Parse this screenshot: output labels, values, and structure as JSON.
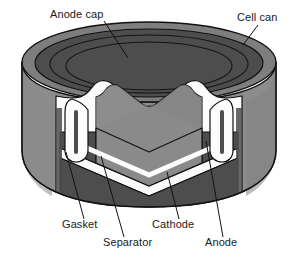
{
  "figure": {
    "view": "three-quarter cutaway with V-shaped wedge removed",
    "background_color": "#ffffff"
  },
  "colors": {
    "cell_can_body": "#8c8c8c",
    "cell_can_top_rim": "#7e7e7e",
    "cathode_dark": "#4d4d4d",
    "anode_mid": "#8a8a8a",
    "anode_cut_face": "#828282",
    "separator_white": "#fbfbfb",
    "gasket_white": "#fcfcfc",
    "outline": "#111111",
    "label_text": "#1a1a1a",
    "leader_line": "#111111"
  },
  "labels": [
    {
      "id": "anode-cap",
      "text": "Anode cap",
      "text_x": 50,
      "text_y": 18,
      "anchor": "start",
      "leader": "M 104 21 L 128 58",
      "points_to": "inner concentric cap disk on top face"
    },
    {
      "id": "cell-can",
      "text": "Cell can",
      "text_x": 237,
      "text_y": 21,
      "anchor": "start",
      "leader": "M 258 25 L 243 45",
      "points_to": "outer steel can wall"
    },
    {
      "id": "gasket",
      "text": "Gasket",
      "text_x": 62,
      "text_y": 228,
      "anchor": "start",
      "leader": "M 84 219 L 66 152",
      "points_to": "white sealing gasket at can rim"
    },
    {
      "id": "separator",
      "text": "Separator",
      "text_x": 103,
      "text_y": 246,
      "anchor": "start",
      "leader": "M 124 237 L 101 156",
      "points_to": "thin white separator layer"
    },
    {
      "id": "cathode",
      "text": "Cathode",
      "text_x": 152,
      "text_y": 228,
      "anchor": "start",
      "leader": "M 179 219 L 167 172",
      "points_to": "dark lower cathode mass"
    },
    {
      "id": "anode",
      "text": "Anode",
      "text_x": 205,
      "text_y": 246,
      "anchor": "start",
      "leader": "M 223 237 L 206 141",
      "points_to": "upper anode mass"
    }
  ],
  "parts": [
    {
      "id": "cell-can",
      "name": "Cell can",
      "role": "outer steel housing"
    },
    {
      "id": "anode-cap",
      "name": "Anode cap",
      "role": "top terminal cap"
    },
    {
      "id": "gasket",
      "name": "Gasket",
      "role": "insulating seal"
    },
    {
      "id": "separator",
      "name": "Separator",
      "role": "ion-permeable membrane"
    },
    {
      "id": "cathode",
      "name": "Cathode",
      "role": "positive electrode"
    },
    {
      "id": "anode",
      "name": "Anode",
      "role": "negative electrode"
    }
  ]
}
